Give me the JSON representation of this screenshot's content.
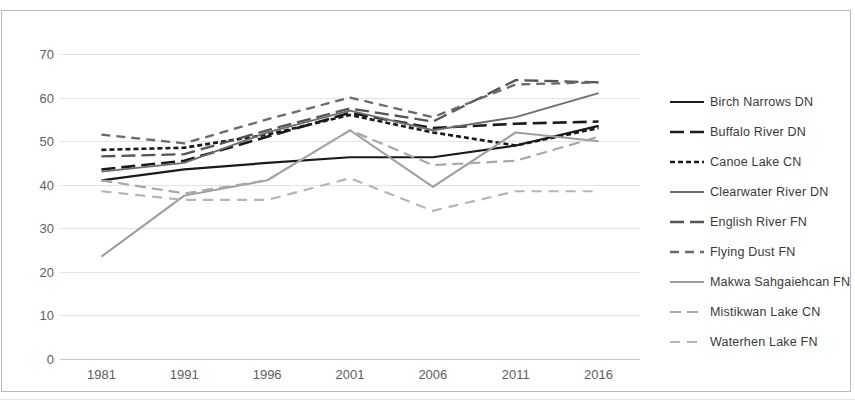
{
  "chart_data": {
    "type": "line",
    "title": "",
    "xlabel": "",
    "ylabel": "",
    "categories": [
      "1981",
      "1991",
      "1996",
      "2001",
      "2006",
      "2011",
      "2016"
    ],
    "ylim": [
      0,
      70
    ],
    "ytick_labels": [
      "0",
      "10",
      "20",
      "30",
      "40",
      "50",
      "60",
      "70"
    ],
    "ytick_values": [
      0,
      10,
      20,
      30,
      40,
      50,
      60,
      70
    ],
    "grid": true,
    "legend_position": "right",
    "series": [
      {
        "name": "Birch Narrows DN",
        "values": [
          41,
          43.5,
          45,
          46.3,
          46.3,
          49,
          53.5
        ],
        "color": "#1a1a1a",
        "style": "solid",
        "dash": "none",
        "width": 2.2
      },
      {
        "name": "Buffalo River DN",
        "values": [
          43.5,
          45.5,
          51,
          56.5,
          53,
          54,
          54.5
        ],
        "color": "#1a1a1a",
        "style": "long-dash",
        "dash": "14,6",
        "width": 2.6
      },
      {
        "name": "Canoe Lake CN",
        "values": [
          48,
          48.5,
          51.5,
          56,
          52,
          49,
          53
        ],
        "color": "#1a1a1a",
        "style": "dotted",
        "dash": "5,3",
        "width": 2.6
      },
      {
        "name": "Clearwater River DN",
        "values": [
          43,
          45,
          52,
          57,
          52.5,
          55.5,
          61
        ],
        "color": "#6e6e6e",
        "style": "solid",
        "dash": "none",
        "width": 1.9
      },
      {
        "name": "English River FN",
        "values": [
          46.5,
          47,
          52.5,
          57.5,
          54.5,
          64,
          63.5
        ],
        "color": "#555555",
        "style": "long-dash",
        "dash": "14,6",
        "width": 2.3
      },
      {
        "name": "Flying Dust FN",
        "values": [
          51.5,
          49.5,
          55,
          60,
          55.5,
          63,
          63.5
        ],
        "color": "#6a6a6a",
        "style": "dash",
        "dash": "9,6",
        "width": 2.3
      },
      {
        "name": "Makwa Sahgaiehcan FN",
        "values": [
          23.5,
          37.5,
          41,
          52.5,
          39.5,
          52,
          50
        ],
        "color": "#9d9d9d",
        "style": "solid",
        "dash": "none",
        "width": 2.0
      },
      {
        "name": "Mistikwan Lake CN",
        "values": [
          41,
          38,
          41,
          52.5,
          44.5,
          45.5,
          51
        ],
        "color": "#a8a8a8",
        "style": "dash",
        "dash": "11,6",
        "width": 2.2
      },
      {
        "name": "Waterhen Lake FN",
        "values": [
          38.5,
          36.5,
          36.5,
          41.5,
          34,
          38.5,
          38.5
        ],
        "color": "#b5b5b5",
        "style": "dash",
        "dash": "10,7",
        "width": 2.2
      }
    ]
  },
  "legend": {
    "items": [
      {
        "label": "Birch Narrows DN"
      },
      {
        "label": "Buffalo River DN"
      },
      {
        "label": "Canoe Lake CN"
      },
      {
        "label": "Clearwater River DN"
      },
      {
        "label": "English River FN"
      },
      {
        "label": "Flying Dust FN"
      },
      {
        "label": "Makwa Sahgaiehcan FN"
      },
      {
        "label": "Mistikwan Lake CN"
      },
      {
        "label": "Waterhen Lake FN"
      }
    ]
  }
}
